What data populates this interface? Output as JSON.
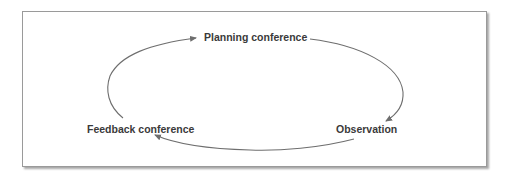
{
  "diagram": {
    "type": "cycle",
    "nodes": [
      {
        "id": "planning",
        "label": "Planning conference"
      },
      {
        "id": "observation",
        "label": "Observation"
      },
      {
        "id": "feedback",
        "label": "Feedback conference"
      }
    ],
    "edges": [
      {
        "from": "planning",
        "to": "observation"
      },
      {
        "from": "observation",
        "to": "feedback"
      },
      {
        "from": "feedback",
        "to": "planning"
      }
    ],
    "colors": {
      "arrow": "#6e6e6e",
      "text": "#3a3a3a",
      "frame_border": "#9a9a9a",
      "background": "#ffffff"
    }
  }
}
